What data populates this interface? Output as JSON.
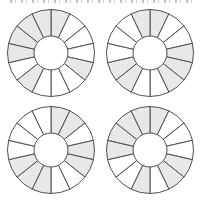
{
  "page": {
    "background_color": "#ffffff",
    "top_edge": {
      "description": "cropped-off text line, only bottom pixel fragments visible, illegible"
    }
  },
  "style": {
    "wedge_stroke_color": "#4f4f4f",
    "wedge_stroke_width": 1,
    "shaded_fill_color": "#e8e8e8",
    "unshaded_fill_color": "#ffffff",
    "outer_radius": 43.5,
    "inner_radius": 17
  },
  "chart_data": [
    {
      "type": "pie",
      "name": "wheel-top-left",
      "segment_count": 14,
      "start_angle_deg": 0,
      "equal_segments": true,
      "shaded_segment_indices": [
        0,
        4,
        8,
        10,
        11,
        12,
        13
      ],
      "title": "",
      "legend": "none",
      "notes": "donut wheel, 14 equal sectors, shaded = light gray, hollow center"
    },
    {
      "type": "pie",
      "name": "wheel-top-right",
      "segment_count": 14,
      "start_angle_deg": 0,
      "equal_segments": true,
      "shaded_segment_indices": [
        0,
        3,
        4,
        5,
        8,
        9,
        13
      ],
      "title": "",
      "legend": "none",
      "notes": "donut wheel, 14 equal sectors, shaded = light gray, hollow center"
    },
    {
      "type": "pie",
      "name": "wheel-bottom-left",
      "segment_count": 14,
      "start_angle_deg": 0,
      "equal_segments": true,
      "shaded_segment_indices": [
        0,
        1,
        3,
        4,
        7,
        8,
        9
      ],
      "title": "",
      "legend": "none",
      "notes": "donut wheel, 14 equal sectors, shaded = light gray, hollow center"
    },
    {
      "type": "pie",
      "name": "wheel-bottom-right",
      "segment_count": 14,
      "start_angle_deg": 0,
      "equal_segments": true,
      "shaded_segment_indices": [
        0,
        4,
        5,
        7,
        10,
        11,
        12,
        13
      ],
      "title": "",
      "legend": "none",
      "notes": "donut wheel, 14 equal sectors, shaded = light gray, hollow center"
    }
  ]
}
